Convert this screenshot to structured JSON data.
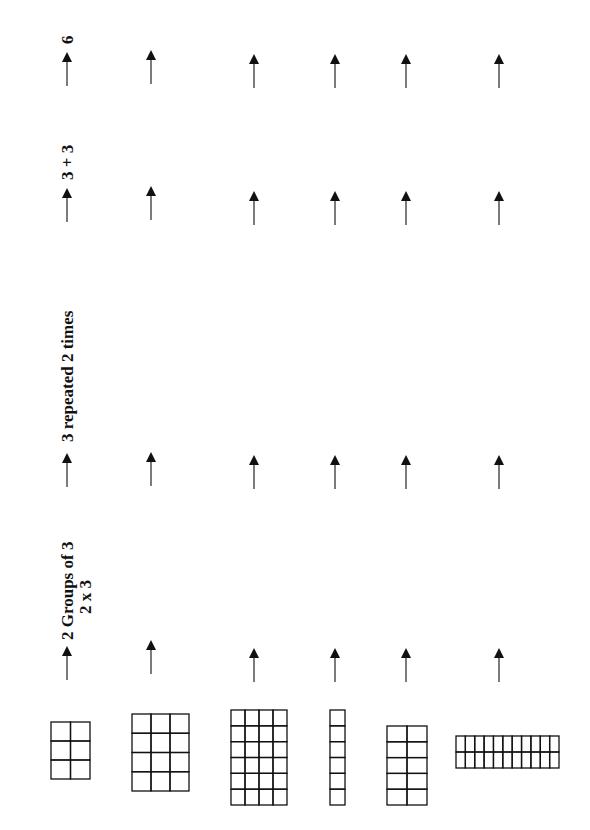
{
  "column_headers": [
    {
      "id": "groups",
      "lines": [
        "2 Groups of 3",
        "2 x 3"
      ]
    },
    {
      "id": "repeated",
      "lines": [
        "3 repeated 2 times"
      ]
    },
    {
      "id": "addition",
      "lines": [
        "3 + 3"
      ]
    },
    {
      "id": "product",
      "lines": [
        "6"
      ]
    }
  ],
  "arrays": [
    {
      "rows_label": "array-2x3",
      "cols": 2,
      "rows": 3
    },
    {
      "rows_label": "array-3x4",
      "cols": 3,
      "rows": 4
    },
    {
      "rows_label": "array-4x6",
      "cols": 4,
      "rows": 6
    },
    {
      "rows_label": "array-1x6",
      "cols": 1,
      "rows": 6
    },
    {
      "rows_label": "array-2x5",
      "cols": 2,
      "rows": 5
    },
    {
      "rows_label": "array-11x2",
      "cols": 11,
      "rows": 2
    }
  ],
  "arrow_icon": "up-arrow-icon",
  "colors": {
    "ink": "#111111",
    "background": "#ffffff"
  }
}
